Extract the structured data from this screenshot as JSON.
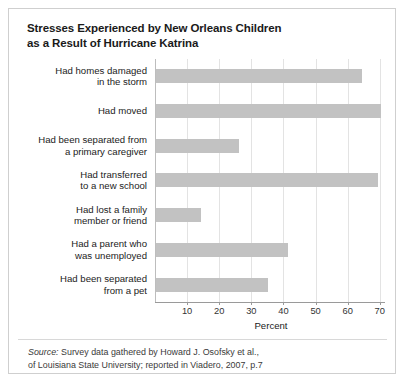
{
  "figure": {
    "title_lines": [
      "Stresses Experienced by New Orleans Children",
      "as a Result of Hurricane Katrina"
    ],
    "source": {
      "label": "Source:",
      "lines": [
        " Survey data gathered by Howard J. Osofsky et al.,",
        "of Louisiana State University; reported in Viadero, 2007, p.7"
      ]
    },
    "colors": {
      "bar_fill": "#c2c2c2",
      "gridline": "#e3e3e3",
      "axis": "#9a9a9a",
      "frame_border": "#cfcfcf",
      "title_text": "#1a1a1a"
    }
  },
  "chart_data": {
    "type": "bar",
    "orientation": "horizontal",
    "title": "Stresses Experienced by New Orleans Children as a Result of Hurricane Katrina",
    "xlabel": "Percent",
    "ylabel": "",
    "xlim": [
      0,
      71
    ],
    "xticks": [
      10,
      20,
      30,
      40,
      50,
      60,
      70
    ],
    "xticklabels": [
      "10",
      "20",
      "30",
      "40",
      "50",
      "60",
      "70"
    ],
    "grid": "vertical",
    "legend": "none",
    "categories": [
      [
        "Had homes damaged",
        "in the storm"
      ],
      [
        "Had moved"
      ],
      [
        "Had been separated from",
        "a primary caregiver"
      ],
      [
        "Had transferred",
        "to a new school"
      ],
      [
        "Had lost a family",
        "member or friend"
      ],
      [
        "Had a parent who",
        "was unemployed"
      ],
      [
        "Had been separated",
        "from a pet"
      ]
    ],
    "category_names": [
      "Had homes damaged in the storm",
      "Had moved",
      "Had been separated from a primary caregiver",
      "Had transferred to a new school",
      "Had lost a family member or friend",
      "Had a parent who was unemployed",
      "Had been separated from a pet"
    ],
    "values": [
      64,
      70,
      26,
      69,
      14,
      41,
      35
    ]
  }
}
